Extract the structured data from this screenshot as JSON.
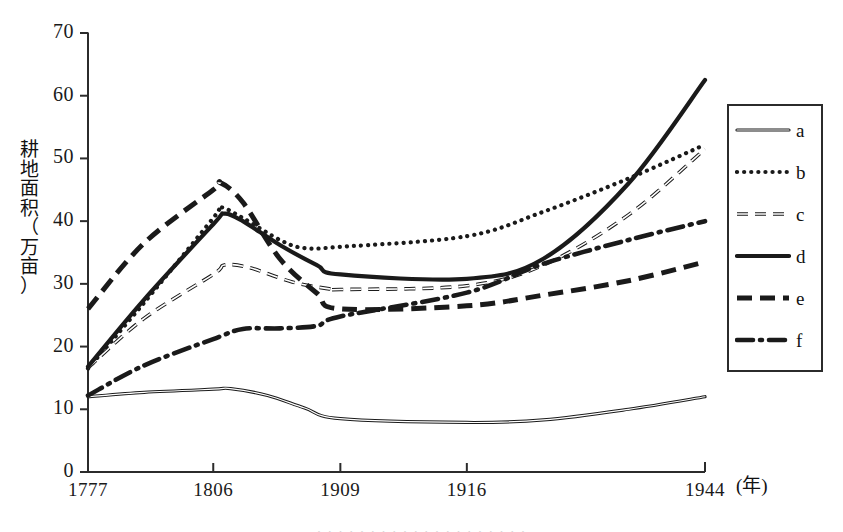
{
  "chart_data": {
    "type": "line",
    "title": "",
    "xlabel": "(年)",
    "ylabel": "耕地面积（万亩）",
    "ylabel_chars": [
      "耕",
      "地",
      "面",
      "积",
      "（",
      "万",
      "亩",
      "）"
    ],
    "x_unit": "(年)",
    "xlim": [
      1777,
      1944
    ],
    "ylim": [
      0,
      70
    ],
    "y_ticks": [
      0,
      10,
      20,
      30,
      40,
      50,
      60,
      70
    ],
    "x_ticks": [
      1777,
      1806,
      1909,
      1916,
      1944
    ],
    "x_tick_labels": [
      "1777",
      "1806",
      "1909",
      "1916",
      "1944"
    ],
    "x_tick_positions_frac": [
      0.0,
      0.203,
      0.409,
      0.614,
      1.0
    ],
    "grid": false,
    "legend_position": "right",
    "legend_entries": [
      "a",
      "b",
      "c",
      "d",
      "e",
      "f"
    ],
    "series": [
      {
        "name": "a",
        "style": "solid-thin",
        "x": [
          1777,
          1790,
          1806,
          1820,
          1850,
          1880,
          1909,
          1916,
          1925,
          1935,
          1944
        ],
        "values": [
          12.0,
          12.7,
          13.2,
          13.3,
          12.2,
          10.2,
          8.5,
          7.9,
          8.3,
          10.0,
          12.0
        ]
      },
      {
        "name": "b",
        "style": "dotted",
        "x": [
          1777,
          1790,
          1806,
          1812,
          1830,
          1860,
          1880,
          1909,
          1916,
          1925,
          1935,
          1944
        ],
        "values": [
          16.5,
          27.0,
          40.5,
          42.2,
          40.5,
          37.0,
          35.7,
          35.9,
          37.6,
          41.5,
          46.8,
          52.2
        ]
      },
      {
        "name": "c",
        "style": "dashed-thin",
        "x": [
          1777,
          1790,
          1806,
          1815,
          1835,
          1870,
          1900,
          1909,
          1916,
          1925,
          1935,
          1944
        ],
        "values": [
          16.6,
          24.5,
          31.5,
          33.0,
          32.6,
          30.3,
          29.2,
          29.1,
          29.7,
          33.0,
          41.0,
          51.5
        ]
      },
      {
        "name": "d",
        "style": "solid-thick",
        "x": [
          1777,
          1790,
          1806,
          1815,
          1830,
          1860,
          1890,
          1909,
          1916,
          1925,
          1935,
          1944
        ],
        "values": [
          16.8,
          27.5,
          39.5,
          41.2,
          40.0,
          36.2,
          33.0,
          31.5,
          30.8,
          34.0,
          46.0,
          62.5
        ]
      },
      {
        "name": "e",
        "style": "dashed-thick",
        "x": [
          1777,
          1790,
          1806,
          1812,
          1830,
          1860,
          1890,
          1909,
          1916,
          1925,
          1935,
          1944
        ],
        "values": [
          26.0,
          36.5,
          45.0,
          46.1,
          43.0,
          34.0,
          28.5,
          26.0,
          26.5,
          28.2,
          30.5,
          33.5
        ]
      },
      {
        "name": "f",
        "style": "dash-dot",
        "x": [
          1777,
          1790,
          1806,
          1830,
          1860,
          1890,
          1909,
          1916,
          1925,
          1935,
          1944
        ],
        "values": [
          12.2,
          17.0,
          21.2,
          22.8,
          22.9,
          23.3,
          24.8,
          28.6,
          33.2,
          37.0,
          40.0
        ]
      }
    ]
  },
  "axes": {
    "y_tick_labels": [
      "70",
      "60",
      "50",
      "40",
      "30",
      "20",
      "10",
      "0"
    ],
    "x_tick_labels": [
      "1777",
      "1806",
      "1909",
      "1916",
      "1944"
    ],
    "x_unit_label": "(年)",
    "y_axis_title": "耕地面积（万亩）"
  },
  "legend": {
    "items": [
      {
        "label": "a",
        "style": "solid-thin"
      },
      {
        "label": "b",
        "style": "dotted"
      },
      {
        "label": "c",
        "style": "dashed-thin"
      },
      {
        "label": "d",
        "style": "solid-thick"
      },
      {
        "label": "e",
        "style": "dashed-thick"
      },
      {
        "label": "f",
        "style": "dash-dot"
      }
    ]
  },
  "colors": {
    "ink": "#1a1a1a",
    "axis": "#2b2b2b",
    "background": "#ffffff"
  },
  "caption": {
    "text": "· · · · · · · · · · · · · · · · · · · ·"
  }
}
